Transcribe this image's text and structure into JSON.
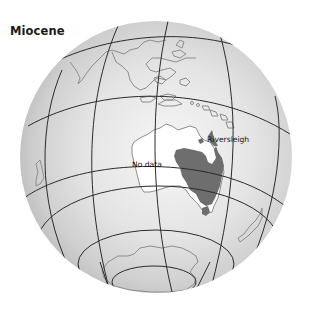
{
  "map": {
    "title": "Miocene",
    "labels": {
      "riversleigh": "Riversleigh",
      "no_data": "No data"
    },
    "colors": {
      "globe_fill_light": "#f4f4f4",
      "globe_fill_dark": "#bdbdbd",
      "graticule": "#2b2b2b",
      "coastline": "#8c8c8c",
      "fossil_region": "#6e6e6e",
      "australia_fill": "#ffffff"
    }
  }
}
